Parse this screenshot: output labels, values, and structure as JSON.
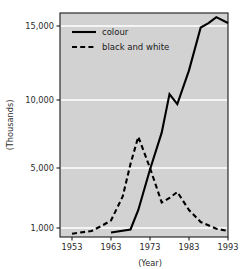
{
  "chart_data": {
    "type": "line",
    "title": "",
    "xlabel": "(Year)",
    "ylabel": "(Thousands)",
    "xlim": [
      1951,
      1994
    ],
    "ylim": [
      500,
      16200
    ],
    "xticks": [
      1953,
      1963,
      1973,
      1983,
      1993
    ],
    "xtick_labels": [
      "1953",
      "1963",
      "1973",
      "1983",
      "1993"
    ],
    "yticks": [
      1000,
      5000,
      10000,
      15000
    ],
    "ytick_labels": [
      "1,000",
      "5,000",
      "10,000",
      "15,000"
    ],
    "grid": true,
    "grid_color": "#ffffff",
    "plot_bgcolor": "#d2d2d2",
    "legend_position": "upper left",
    "series": [
      {
        "name": "colour",
        "style": "solid",
        "color": "#000000",
        "x": [
          1963,
          1968,
          1970,
          1973,
          1976,
          1978,
          1980,
          1983,
          1986,
          1988,
          1990,
          1993
        ],
        "values": [
          700,
          900,
          2200,
          4900,
          7600,
          10400,
          9700,
          12000,
          14900,
          15200,
          15600,
          15200
        ]
      },
      {
        "name": "black and white",
        "style": "dashed",
        "color": "#000000",
        "x": [
          1953,
          1958,
          1961,
          1963,
          1966,
          1968,
          1970,
          1973,
          1976,
          1978,
          1980,
          1983,
          1986,
          1990,
          1993
        ],
        "values": [
          620,
          800,
          1200,
          1500,
          3100,
          5300,
          7300,
          5000,
          2700,
          3000,
          3400,
          2200,
          1400,
          950,
          800
        ]
      }
    ]
  },
  "legend": {
    "items": [
      {
        "label": "colour",
        "style": "solid"
      },
      {
        "label": "black and white",
        "style": "dashed"
      }
    ]
  },
  "axes": {
    "y_title": "(Thousands)",
    "x_title": "(Year)"
  }
}
